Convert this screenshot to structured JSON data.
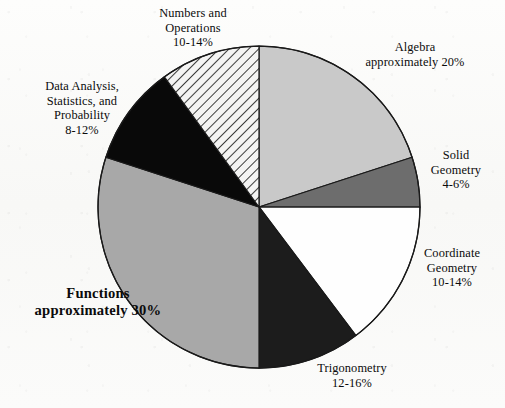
{
  "chart_data": {
    "type": "pie",
    "title": "",
    "subtitle": "",
    "legend_position": "labels-around-pie",
    "grid": false,
    "total_percent": 100,
    "center": {
      "x": 259,
      "y": 207
    },
    "radius": 161,
    "start_angle_deg": 0,
    "direction": "clockwise",
    "categories": [
      "Algebra",
      "Solid Geometry",
      "Coordinate Geometry",
      "Trigonometry",
      "Functions",
      "Data Analysis, Statistics, and Probability",
      "Numbers and Operations"
    ],
    "values": [
      20,
      5,
      14.7,
      10.3,
      30,
      10,
      10
    ],
    "slices": [
      {
        "name": "Algebra",
        "label_lines": [
          "Algebra",
          "approximately 20%"
        ],
        "percent_text": "approximately 20%",
        "percent_value": 20,
        "range_low": 20,
        "range_high": 20,
        "start_angle": 0,
        "end_angle": 72,
        "fill": "#c9c9c9",
        "pattern": "solid",
        "stroke": "#1a1a1a"
      },
      {
        "name": "Solid Geometry",
        "label_lines": [
          "Solid",
          "Geometry",
          "4-6%"
        ],
        "percent_text": "4-6%",
        "percent_value": 5,
        "range_low": 4,
        "range_high": 6,
        "start_angle": 72,
        "end_angle": 90,
        "fill": "#6d6d6d",
        "pattern": "solid",
        "stroke": "#1a1a1a"
      },
      {
        "name": "Coordinate Geometry",
        "label_lines": [
          "Coordinate",
          "Geometry",
          "10-14%"
        ],
        "percent_text": "10-14%",
        "percent_value": 12,
        "range_low": 10,
        "range_high": 14,
        "start_angle": 90,
        "end_angle": 143,
        "fill": "#fefefe",
        "pattern": "solid",
        "stroke": "#1a1a1a"
      },
      {
        "name": "Trigonometry",
        "label_lines": [
          "Trigonometry",
          "12-16%"
        ],
        "percent_text": "12-16%",
        "percent_value": 14,
        "range_low": 12,
        "range_high": 16,
        "start_angle": 143,
        "end_angle": 180,
        "fill": "#1c1c1c",
        "pattern": "solid",
        "stroke": "#1a1a1a"
      },
      {
        "name": "Functions",
        "label_lines": [
          "Functions",
          "approximately 30%"
        ],
        "percent_text": "approximately 30%",
        "percent_value": 30,
        "range_low": 30,
        "range_high": 30,
        "start_angle": 180,
        "end_angle": 288,
        "fill": "#a8a8a8",
        "pattern": "solid",
        "stroke": "#1a1a1a",
        "emphasis": true
      },
      {
        "name": "Data Analysis, Statistics, and Probability",
        "label_lines": [
          "Data Analysis,",
          "Statistics, and",
          "Probability",
          "8-12%"
        ],
        "percent_text": "8-12%",
        "percent_value": 10,
        "range_low": 8,
        "range_high": 12,
        "start_angle": 288,
        "end_angle": 324,
        "fill": "#090909",
        "pattern": "solid",
        "stroke": "#1a1a1a"
      },
      {
        "name": "Numbers and Operations",
        "label_lines": [
          "Numbers and",
          "Operations",
          "10-14%"
        ],
        "percent_text": "10-14%",
        "percent_value": 12,
        "range_low": 10,
        "range_high": 14,
        "start_angle": 324,
        "end_angle": 360,
        "fill": "#f2f2f2",
        "pattern": "diagonal-hatch",
        "stroke": "#1a1a1a"
      }
    ]
  },
  "labels": {
    "numbers_operations": {
      "line1": "Numbers and",
      "line2": "Operations",
      "line3": "10-14%"
    },
    "algebra": {
      "line1": "Algebra",
      "line2": "approximately 20%"
    },
    "solid_geometry": {
      "line1": "Solid",
      "line2": "Geometry",
      "line3": "4-6%"
    },
    "coordinate_geometry": {
      "line1": "Coordinate",
      "line2": "Geometry",
      "line3": "10-14%"
    },
    "trigonometry": {
      "line1": "Trigonometry",
      "line2": "12-16%"
    },
    "functions": {
      "line1": "Functions",
      "line2": "approximately 30%"
    },
    "data_analysis": {
      "line1": "Data Analysis,",
      "line2": "Statistics, and",
      "line3": "Probability",
      "line4": "8-12%"
    }
  },
  "colors": {
    "algebra": "#c9c9c9",
    "solid_geometry": "#6d6d6d",
    "coordinate_geometry": "#fefefe",
    "trigonometry": "#1c1c1c",
    "functions": "#a8a8a8",
    "data_analysis": "#090909",
    "numbers_operations": "#f2f2f2",
    "outline": "#1a1a1a",
    "text": "#0b0b0b",
    "background": "#fcfcfb"
  }
}
